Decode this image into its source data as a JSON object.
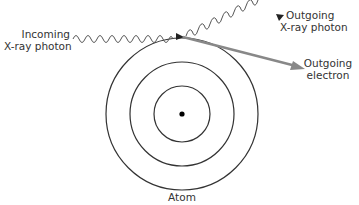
{
  "labels": {
    "incoming_line1": "Incoming",
    "incoming_line2": "X-ray photon",
    "outgoing_photon_line1": "Outgoing",
    "outgoing_photon_line2": "X-ray photon",
    "outgoing_electron_line1": "Outgoing",
    "outgoing_electron_line2": "electron",
    "atom": "Atom"
  },
  "colors": {
    "orbit": "#333333",
    "photon": "#555555",
    "electron_arrow": "#808080",
    "nucleus": "#000000",
    "text": "#333333"
  },
  "atom": {
    "center": [
      182,
      114
    ],
    "orbit_radii": [
      28,
      52,
      76
    ],
    "nucleus_radius": 2.5
  }
}
